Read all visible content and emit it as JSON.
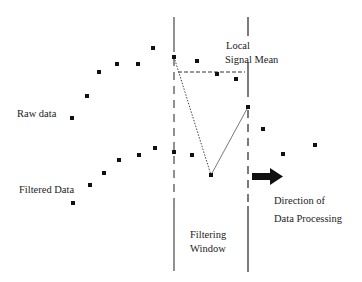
{
  "labels": {
    "raw_data": "Raw data",
    "filtered_data": "Filtered Data",
    "local_signal_mean_1": "Local",
    "local_signal_mean_2": "Signal Mean",
    "filtering_window_1": "Filtering",
    "filtering_window_2": "Window",
    "direction_1": "Direction of",
    "direction_2": "Data Processing"
  },
  "colors": {
    "ink": "#111111",
    "line": "#444444",
    "background": "#ffffff"
  },
  "raw_points": [
    [
      72,
      118
    ],
    [
      87,
      96
    ],
    [
      99,
      72
    ],
    [
      117,
      64
    ],
    [
      138,
      64
    ],
    [
      153,
      48
    ],
    [
      174,
      57
    ],
    [
      197,
      61
    ],
    [
      217,
      74
    ],
    [
      236,
      79
    ],
    [
      248,
      107
    ],
    [
      263,
      129
    ],
    [
      283,
      154
    ],
    [
      315,
      145
    ]
  ],
  "filtered_points": [
    [
      73,
      203
    ],
    [
      90,
      185
    ],
    [
      104,
      173
    ],
    [
      119,
      160
    ],
    [
      139,
      155
    ],
    [
      155,
      148
    ],
    [
      174,
      152
    ],
    [
      192,
      155
    ],
    [
      211,
      175
    ]
  ],
  "window": {
    "left_x": 174,
    "right_x": 248,
    "top_y": 17,
    "bottom_y": 271
  },
  "mean_line": {
    "x1": 178,
    "x2": 245,
    "y": 72
  }
}
